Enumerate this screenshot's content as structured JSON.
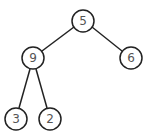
{
  "diagram": {
    "type": "binary-tree",
    "colors": {
      "stroke": "#222222",
      "label": "#555555",
      "background": "#ffffff"
    },
    "nodes": [
      {
        "id": "n5",
        "label": "5",
        "x": 83,
        "y": 21
      },
      {
        "id": "n9",
        "label": "9",
        "x": 33,
        "y": 58
      },
      {
        "id": "n6",
        "label": "6",
        "x": 131,
        "y": 58
      },
      {
        "id": "n3",
        "label": "3",
        "x": 16,
        "y": 119
      },
      {
        "id": "n2",
        "label": "2",
        "x": 50,
        "y": 119
      }
    ],
    "edges": [
      {
        "from": "5",
        "to": "9"
      },
      {
        "from": "5",
        "to": "6"
      },
      {
        "from": "9",
        "to": "3"
      },
      {
        "from": "9",
        "to": "2"
      }
    ]
  }
}
